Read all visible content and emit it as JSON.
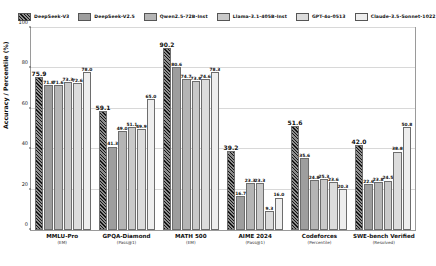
{
  "chart_data": {
    "type": "bar",
    "title": "",
    "xlabel": "",
    "ylabel": "Accuracy / Percentile (%)",
    "ylim": [
      0,
      100
    ],
    "yticks": [
      0,
      20,
      40,
      60,
      80,
      100
    ],
    "grid": true,
    "legend_position": "top",
    "categories": [
      "MMLU-Pro",
      "GPQA-Diamond",
      "MATH 500",
      "AIME 2024",
      "Codeforces",
      "SWE-bench Verified"
    ],
    "category_subtitles": [
      "(EM)",
      "(Pass@1)",
      "(EM)",
      "(Pass@1)",
      "(Percentile)",
      "(Resolved)"
    ],
    "series": [
      {
        "name": "DeepSeek-V3",
        "color": "#8d8d8d",
        "hatch": true,
        "values": [
          75.9,
          59.1,
          90.2,
          39.2,
          51.6,
          42.0
        ]
      },
      {
        "name": "DeepSeek-V2.5",
        "color": "#9e9e9e",
        "hatch": false,
        "values": [
          71.8,
          41.3,
          80.6,
          16.7,
          35.6,
          22.6
        ]
      },
      {
        "name": "Qwen2.5-72B-Inst",
        "color": "#b5b5b5",
        "hatch": false,
        "values": [
          71.6,
          49.0,
          74.7,
          23.3,
          24.8,
          23.8
        ]
      },
      {
        "name": "Llama-3.1-405B-Inst",
        "color": "#c9c9c9",
        "hatch": false,
        "values": [
          73.3,
          51.1,
          73.8,
          23.3,
          25.3,
          24.5
        ]
      },
      {
        "name": "GPT-4o-0513",
        "color": "#dcdcdc",
        "hatch": false,
        "values": [
          72.6,
          49.9,
          74.6,
          9.3,
          23.6,
          38.8
        ]
      },
      {
        "name": "Claude-3.5-Sonnet-1022",
        "color": "#eeeeee",
        "hatch": false,
        "values": [
          78.0,
          65.0,
          78.3,
          16.0,
          20.3,
          50.8
        ]
      }
    ]
  },
  "axis": {
    "y_title": "Accuracy / Percentile (%)",
    "y_tick_labels": [
      "0",
      "20",
      "40",
      "60",
      "80",
      "100"
    ]
  }
}
